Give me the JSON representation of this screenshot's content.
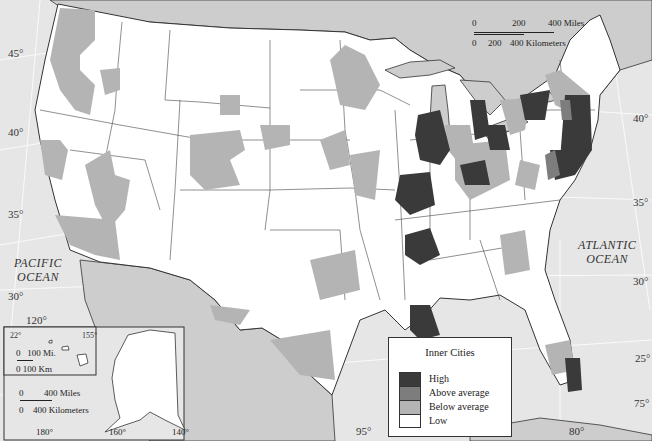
{
  "map": {
    "title": "Inner Cities",
    "oceans": [
      {
        "name": "pacific",
        "label": "PACIFIC\nOCEAN"
      },
      {
        "name": "atlantic",
        "label": "ATLANTIC\nOCEAN"
      }
    ],
    "latitude_labels": {
      "west_45": "45°",
      "west_40": "40°",
      "west_35": "35°",
      "west_30": "30°",
      "east_40": "40°",
      "east_35": "35°",
      "east_30": "30°",
      "east_25": "25°"
    },
    "longitude_labels": {
      "lon_120": "120°",
      "lon_95": "95°",
      "lon_80": "80°",
      "lon_75": "75°"
    },
    "scale_bar": {
      "miles_0": "0",
      "miles_200": "200",
      "miles_400": "400 Miles",
      "km_0": "0",
      "km_200": "200",
      "km_400": "400 Kilometers"
    },
    "inset_hawaii": {
      "lat": "22°",
      "lon": "155°",
      "scale_miles": "0   100 Mi.",
      "scale_km": "0 100 Km"
    },
    "inset_alaska": {
      "scale_miles_0": "0",
      "scale_miles": "400 Miles",
      "scale_km_0": "0",
      "scale_km": "400 Kilometers",
      "lon_180": "180°",
      "lon_160": "160°",
      "lon_140": "140°"
    }
  },
  "legend": {
    "title": "Inner Cities",
    "items": [
      {
        "label": "High",
        "color": "#3a3a3a"
      },
      {
        "label": "Above average",
        "color": "#7d7d7d"
      },
      {
        "label": "Below average",
        "color": "#b4b4b4"
      },
      {
        "label": "Low",
        "color": "#ffffff"
      }
    ]
  },
  "colors": {
    "water": "#e6e6e6",
    "foreign_land": "#cdcdcd",
    "us_land": "#ffffff",
    "high": "#3a3a3a",
    "above": "#7d7d7d",
    "below": "#b4b4b4"
  }
}
